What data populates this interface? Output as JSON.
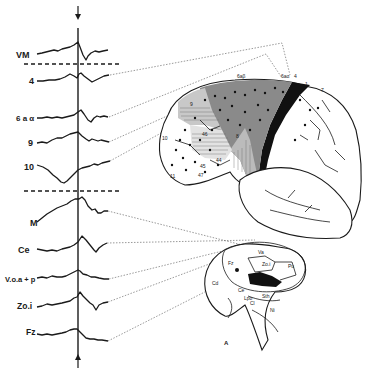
{
  "figure": {
    "type": "neurophysiology figure: averaged evoked potentials with recording site maps",
    "time_marker": {
      "top_arrow": "down-arrow",
      "bottom_arrow": "up-arrow"
    }
  },
  "cortical_traces": {
    "group_label": "cortical recordings",
    "items": [
      {
        "label": "VM"
      },
      {
        "label": "4"
      },
      {
        "label": "6 a α"
      },
      {
        "label": "9"
      },
      {
        "label": "10"
      }
    ]
  },
  "subcortical_traces": {
    "group_label": "subcortical recordings",
    "items": [
      {
        "label": "M"
      },
      {
        "label": "Ce"
      },
      {
        "label": "V.o.a + p"
      },
      {
        "label": "Zo.i"
      },
      {
        "label": "Fz"
      }
    ]
  },
  "brain_lateral": {
    "area_labels": [
      "6aβ",
      "6aα",
      "4",
      "1",
      "7",
      "8",
      "9",
      "46",
      "10",
      "45",
      "44",
      "47",
      "11"
    ],
    "dots_description": "recording sites"
  },
  "thalamus_section": {
    "labels": [
      "Cd",
      "Ce",
      "Pu",
      "Fz",
      "Zo.i",
      "Sth",
      "Ni",
      "Lpo",
      "Va",
      "Cl"
    ],
    "corner_mark": "A"
  }
}
